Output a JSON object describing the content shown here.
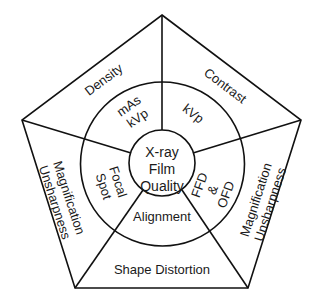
{
  "diagram": {
    "center": {
      "lines": [
        "X-ray",
        "Film",
        "Quality"
      ]
    },
    "inner_ring": {
      "top_left": [
        "mAs",
        "kVp"
      ],
      "top_right": [
        "kVp"
      ],
      "right": [
        "FFD",
        "&",
        "OFD"
      ],
      "bottom": [
        "Alignment"
      ],
      "left": [
        "Focal",
        "Spot"
      ]
    },
    "outer_ring": {
      "top_left": [
        "Density"
      ],
      "top_right": [
        "Contrast"
      ],
      "right": [
        "Magnification",
        "Unsharpness"
      ],
      "bottom": [
        "Shape Distortion"
      ],
      "left": [
        "Magnification",
        "Unsharpness"
      ]
    },
    "colors": {
      "line": "#111111",
      "text": "#1a1a1a",
      "background": "#ffffff"
    }
  }
}
